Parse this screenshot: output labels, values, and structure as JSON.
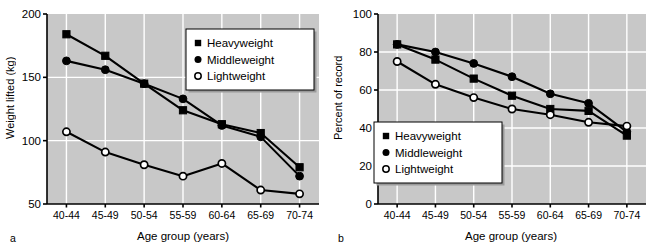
{
  "figure": {
    "panels": [
      {
        "letter": "a",
        "chart_index": 0
      },
      {
        "letter": "b",
        "chart_index": 1
      }
    ]
  },
  "chart_data": [
    {
      "type": "line",
      "title": "",
      "panel_label": "a",
      "xlabel": "Age group (years)",
      "ylabel": "Weight lifted (kg)",
      "categories": [
        "40-44",
        "45-49",
        "50-54",
        "55-59",
        "60-64",
        "65-69",
        "70-74"
      ],
      "ylim": [
        50,
        200
      ],
      "yticks": [
        50,
        100,
        150,
        200
      ],
      "ytick_labels": [
        "50",
        "100",
        "150",
        "200"
      ],
      "grid": true,
      "grid_color": "#ffffff",
      "plot_background": "#c8c8c8",
      "legend_position": "upper-right",
      "series": [
        {
          "name": "Heavyweight",
          "marker": "filled-square",
          "values": [
            184,
            167,
            145,
            124,
            113,
            106,
            79
          ]
        },
        {
          "name": "Middleweight",
          "marker": "filled-circle",
          "values": [
            163,
            156,
            145,
            133,
            112,
            103,
            72
          ]
        },
        {
          "name": "Lightweight",
          "marker": "open-circle",
          "values": [
            107,
            91,
            81,
            72,
            82,
            61,
            58
          ]
        }
      ]
    },
    {
      "type": "line",
      "title": "",
      "panel_label": "b",
      "xlabel": "Age group (years)",
      "ylabel": "Percent of record",
      "categories": [
        "40-44",
        "45-49",
        "50-54",
        "55-59",
        "60-64",
        "65-69",
        "70-74"
      ],
      "ylim": [
        0,
        100
      ],
      "yticks": [
        0,
        20,
        40,
        60,
        80,
        100
      ],
      "ytick_labels": [
        "0",
        "20",
        "40",
        "60",
        "80",
        "100"
      ],
      "grid": true,
      "grid_color": "#ffffff",
      "plot_background": "#c8c8c8",
      "legend_position": "lower-left",
      "series": [
        {
          "name": "Heavyweight",
          "marker": "filled-square",
          "values": [
            84,
            76,
            66,
            57,
            50,
            49,
            36
          ]
        },
        {
          "name": "Middleweight",
          "marker": "filled-circle",
          "values": [
            84,
            80,
            74,
            67,
            58,
            53,
            38
          ]
        },
        {
          "name": "Lightweight",
          "marker": "open-circle",
          "values": [
            75,
            63,
            56,
            50,
            47,
            43,
            41
          ]
        }
      ]
    }
  ]
}
